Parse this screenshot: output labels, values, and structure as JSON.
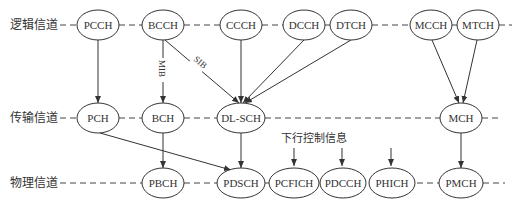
{
  "rows": [
    {
      "id": "logical",
      "label": "逻辑信道",
      "y": 25
    },
    {
      "id": "transport",
      "label": "传输信道",
      "y": 118
    },
    {
      "id": "physical",
      "label": "物理信道",
      "y": 183
    }
  ],
  "nodes": {
    "PCCH": {
      "label": "PCCH",
      "x": 98,
      "y": 25,
      "rx": 21,
      "ry": 15
    },
    "BCCH": {
      "label": "BCCH",
      "x": 163,
      "y": 25,
      "rx": 21,
      "ry": 15
    },
    "CCCH": {
      "label": "CCCH",
      "x": 241,
      "y": 25,
      "rx": 21,
      "ry": 15
    },
    "DCCH": {
      "label": "DCCH",
      "x": 304,
      "y": 25,
      "rx": 21,
      "ry": 15
    },
    "DTCH": {
      "label": "DTCH",
      "x": 351,
      "y": 25,
      "rx": 21,
      "ry": 15
    },
    "MCCH": {
      "label": "MCCH",
      "x": 431,
      "y": 25,
      "rx": 21,
      "ry": 15
    },
    "MTCH": {
      "label": "MTCH",
      "x": 478,
      "y": 25,
      "rx": 21,
      "ry": 15
    },
    "PCH": {
      "label": "PCH",
      "x": 98,
      "y": 118,
      "rx": 21,
      "ry": 15
    },
    "BCH": {
      "label": "BCH",
      "x": 163,
      "y": 118,
      "rx": 21,
      "ry": 15
    },
    "DLSCH": {
      "label": "DL-SCH",
      "x": 241,
      "y": 118,
      "rx": 24,
      "ry": 15
    },
    "MCH": {
      "label": "MCH",
      "x": 461,
      "y": 118,
      "rx": 21,
      "ry": 15
    },
    "PBCH": {
      "label": "PBCH",
      "x": 163,
      "y": 183,
      "rx": 21,
      "ry": 15
    },
    "PDSCH": {
      "label": "PDSCH",
      "x": 241,
      "y": 183,
      "rx": 24,
      "ry": 15
    },
    "PCFICH": {
      "label": "PCFICH",
      "x": 294,
      "y": 183,
      "rx": 25,
      "ry": 15
    },
    "PDCCH": {
      "label": "PDCCH",
      "x": 346,
      "y": 183,
      "rx": 23,
      "ry": 15
    },
    "PHICH": {
      "label": "PHICH",
      "x": 394,
      "y": 183,
      "rx": 23,
      "ry": 15
    },
    "PMCH": {
      "label": "PMCH",
      "x": 461,
      "y": 183,
      "rx": 22,
      "ry": 15
    }
  },
  "edges": [
    {
      "from": "PCCH",
      "to": "PCH",
      "label": ""
    },
    {
      "from": "BCCH",
      "to": "BCH",
      "label": "MIB"
    },
    {
      "from": "BCCH",
      "to": "DLSCH",
      "label": "SIB"
    },
    {
      "from": "CCCH",
      "to": "DLSCH",
      "label": ""
    },
    {
      "from": "DCCH",
      "to": "DLSCH",
      "label": ""
    },
    {
      "from": "DTCH",
      "to": "DLSCH",
      "label": ""
    },
    {
      "from": "MCCH",
      "to": "MCH",
      "label": ""
    },
    {
      "from": "MTCH",
      "to": "MCH",
      "label": ""
    },
    {
      "from": "PCH",
      "to": "PDSCH",
      "label": ""
    },
    {
      "from": "BCH",
      "to": "PBCH",
      "label": ""
    },
    {
      "from": "DLSCH",
      "to": "PDSCH",
      "label": ""
    },
    {
      "from": "MCH",
      "to": "PMCH",
      "label": ""
    }
  ],
  "annotation": {
    "label": "下行控制信息",
    "targets": [
      "PCFICH",
      "PDCCH",
      "PHICH"
    ]
  },
  "mib_label": "MIB",
  "sib_label": "SIB"
}
